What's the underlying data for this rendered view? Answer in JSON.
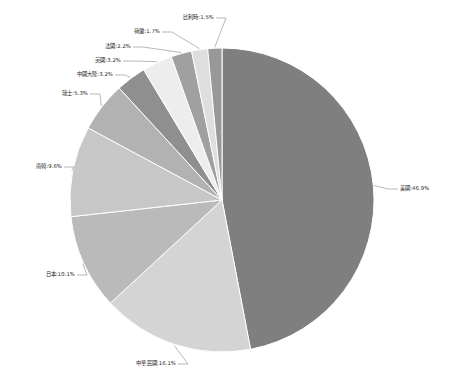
{
  "chart_data": {
    "type": "pie",
    "title": "",
    "subtitle": "",
    "xlabel": "",
    "ylabel": "",
    "legend_position": "none",
    "grid": false,
    "label_format": "{name}:{value}%",
    "start_angle_deg": 0,
    "direction": "clockwise",
    "categories": [
      "美國",
      "中華民國",
      "日本",
      "南韓",
      "瑞士",
      "中國大陸",
      "英國",
      "法國",
      "荷蘭",
      "比利時"
    ],
    "values": [
      46.9,
      16.1,
      10.1,
      9.6,
      5.3,
      3.2,
      3.2,
      2.2,
      1.7,
      1.5
    ],
    "colors": [
      "#7f7f7f",
      "#d4d4d4",
      "#bababa",
      "#c7c7c7",
      "#b2b2b2",
      "#8f8f8f",
      "#ededed",
      "#a0a0a0",
      "#dedede",
      "#989898"
    ],
    "labels": [
      "美國:46.9%",
      "中華民國:16.1%",
      "日本:10.1%",
      "南韓:9.6%",
      "瑞士:5.3%",
      "中國大陸:3.2%",
      "英國:3.2%",
      "法國:2.2%",
      "荷蘭:1.7%",
      "比利時:1.5%"
    ],
    "label_positions": [
      {
        "x": 400,
        "y": 189,
        "anchor": "start"
      },
      {
        "x": 176,
        "y": 364,
        "anchor": "end"
      },
      {
        "x": 75,
        "y": 275,
        "anchor": "end"
      },
      {
        "x": 62,
        "y": 167,
        "anchor": "end"
      },
      {
        "x": 88,
        "y": 94,
        "anchor": "end"
      },
      {
        "x": 113,
        "y": 75,
        "anchor": "end"
      },
      {
        "x": 121,
        "y": 61,
        "anchor": "end"
      },
      {
        "x": 131,
        "y": 47,
        "anchor": "end"
      },
      {
        "x": 160,
        "y": 32,
        "anchor": "end"
      },
      {
        "x": 214,
        "y": 18,
        "anchor": "end"
      }
    ]
  },
  "figure": {
    "center_x": 222,
    "center_y": 200,
    "radius": 152,
    "background": "#ffffff"
  }
}
